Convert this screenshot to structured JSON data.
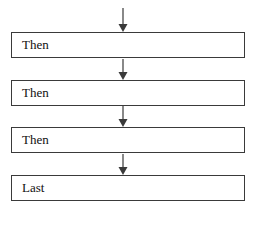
{
  "diagram": {
    "type": "flowchart",
    "steps": [
      {
        "label": "Then"
      },
      {
        "label": "Then"
      },
      {
        "label": "Then"
      },
      {
        "label": "Last"
      }
    ],
    "colors": {
      "stroke": "#3a3a3a",
      "text": "#111111",
      "background": "#ffffff"
    }
  }
}
